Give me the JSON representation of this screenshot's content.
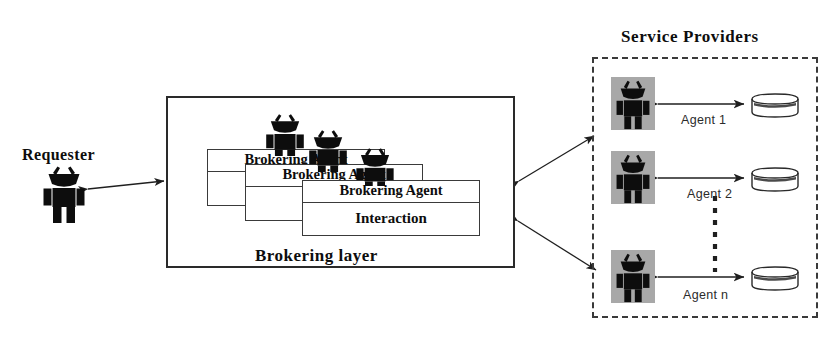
{
  "diagram": {
    "title_service_providers": "Service Providers",
    "requester": {
      "label": "Requester",
      "icon": "agent-person-icon"
    },
    "brokering_layer": {
      "label": "Brokering layer",
      "cards": [
        {
          "title": "Brokering Agent",
          "body": ""
        },
        {
          "title": "Brokering Agent",
          "body": ""
        },
        {
          "title": "Brokering Agent",
          "body": "Interaction"
        }
      ]
    },
    "service_providers": [
      {
        "label": "Agent 1",
        "icon": "agent-person-icon",
        "store": "database-cylinder-icon"
      },
      {
        "label": "Agent 2",
        "icon": "agent-person-icon",
        "store": "database-cylinder-icon"
      },
      {
        "label": "Agent n",
        "icon": "agent-person-icon",
        "store": "database-cylinder-icon"
      }
    ],
    "ellipsis": "vertical-dotted-ellipsis",
    "colors": {
      "stroke": "#2a2a2a",
      "figure": "#0d0d0d",
      "plate": "#a8a8a8",
      "background": "#ffffff"
    }
  }
}
